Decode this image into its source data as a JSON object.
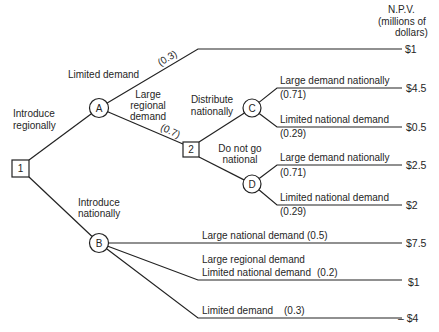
{
  "header": {
    "line1": "N.P.V.",
    "line2": "(millions of",
    "line3": "dollars)"
  },
  "tree": {
    "root": {
      "id": "1",
      "options": [
        {
          "label_lines": [
            "Introduce",
            "regionally"
          ]
        },
        {
          "label_lines": [
            "Introduce",
            "nationally"
          ]
        }
      ]
    },
    "node_a": {
      "id": "A",
      "outcomes": [
        {
          "label": "Limited demand",
          "probability": "(0.3)",
          "npv": "$1"
        },
        {
          "label_lines": [
            "Large",
            "regional",
            "demand"
          ],
          "probability": "(0.7)"
        }
      ]
    },
    "node_2": {
      "id": "2",
      "options": [
        {
          "label_lines": [
            "Distribute",
            "nationally"
          ]
        },
        {
          "label_lines": [
            "Do not go",
            "national"
          ]
        }
      ]
    },
    "node_c": {
      "id": "C",
      "outcomes": [
        {
          "label": "Large demand nationally",
          "probability": "(0.71)",
          "npv": "$4.5"
        },
        {
          "label": "Limited national demand",
          "probability": "(0.29)",
          "npv": "$0.5"
        }
      ]
    },
    "node_d": {
      "id": "D",
      "outcomes": [
        {
          "label": "Large demand nationally",
          "probability": "(0.71)",
          "npv": "$2.5"
        },
        {
          "label": "Limited national demand",
          "probability": "(0.29)",
          "npv": "$2"
        }
      ]
    },
    "node_b": {
      "id": "B",
      "outcomes": [
        {
          "label": "Large national demand",
          "probability": "(0.5)",
          "npv": "$7.5"
        },
        {
          "label_lines": [
            "Large regional demand",
            "Limited national demand"
          ],
          "probability": "(0.2)",
          "npv": "$1"
        },
        {
          "label": "Limited demand",
          "probability": "(0.3)",
          "npv": "– $4"
        }
      ]
    }
  }
}
